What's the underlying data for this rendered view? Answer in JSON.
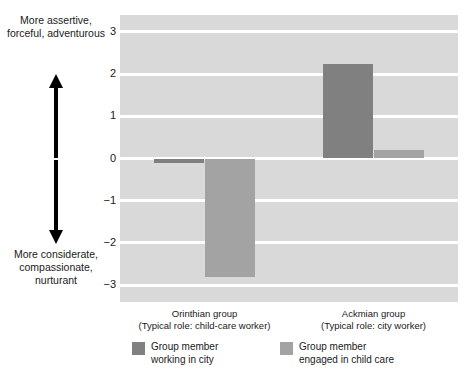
{
  "annotations": {
    "top": "More\nassertive,\nforceful,\nadventurous",
    "bottom": "More\nconsiderate,\ncompassionate,\nnurturant",
    "up_arrow_icon": "up-arrow-icon",
    "down_arrow_icon": "down-arrow-icon"
  },
  "colors": {
    "plot_background": "#d9d9d9",
    "gridline": "#ffffff",
    "series_dark": "#808080",
    "series_light": "#a3a3a3",
    "text": "#1a1a1a"
  },
  "chart_data": {
    "type": "bar",
    "title": "",
    "xlabel": "",
    "ylabel": "",
    "ylim": [
      -3.4,
      3.4
    ],
    "yticks": [
      3,
      2,
      1,
      0,
      -1,
      -2,
      -3
    ],
    "ytick_labels": [
      "3",
      "2",
      "1",
      "0",
      "−1",
      "−2",
      "−3"
    ],
    "grid": true,
    "legend_position": "bottom",
    "categories": [
      "Orinthian group",
      "Ackmian group"
    ],
    "category_sublabels": [
      "(Typical role: child-care worker)",
      "(Typical role: city worker)"
    ],
    "series": [
      {
        "name": "Group member\nworking in city",
        "color": "#808080",
        "values": [
          -0.1,
          2.25
        ]
      },
      {
        "name": "Group member\nengaged in child care",
        "color": "#a3a3a3",
        "values": [
          -2.8,
          0.2
        ]
      }
    ]
  },
  "legend": {
    "entries": [
      {
        "label": "Group member\nworking in city",
        "color": "#808080"
      },
      {
        "label": "Group member\nengaged in child care",
        "color": "#a3a3a3"
      }
    ]
  }
}
